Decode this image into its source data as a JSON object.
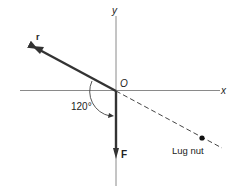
{
  "diagram": {
    "axes": {
      "x_label": "x",
      "y_label": "y",
      "origin_label": "O"
    },
    "vectors": {
      "r": {
        "label": "r",
        "direction": "up-left"
      },
      "F": {
        "label": "F",
        "direction": "down"
      }
    },
    "angle": {
      "label": "120°",
      "between": [
        "r",
        "F"
      ]
    },
    "point": {
      "label": "Lug nut"
    },
    "colors": {
      "axis": "#888888",
      "vector": "#333333",
      "text": "#222222",
      "background": "#ffffff"
    }
  }
}
